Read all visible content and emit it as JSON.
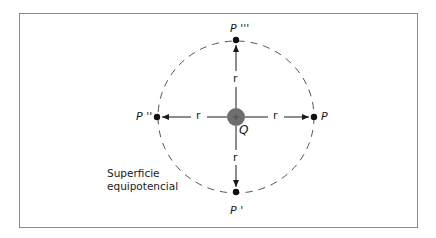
{
  "diagram": {
    "title": "Superficie equipotencial",
    "caption_lines": [
      "Superficie",
      "equipotencial"
    ],
    "charge": {
      "label": "Q",
      "fill": "#6e6e6e"
    },
    "points": [
      {
        "id": "P",
        "label": "P"
      },
      {
        "id": "P1",
        "label": "P '"
      },
      {
        "id": "P2",
        "label": "P ''"
      },
      {
        "id": "P3",
        "label": "P '''"
      }
    ],
    "radius_label": "r",
    "colors": {
      "frame": "#8a8a8a",
      "line": "#1a1a1a",
      "dash": "#555555"
    }
  }
}
